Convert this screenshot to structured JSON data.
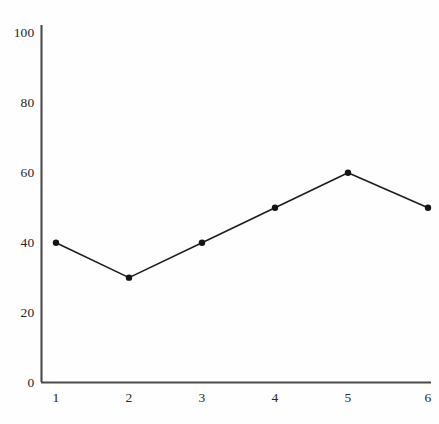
{
  "chart_data": {
    "type": "line",
    "title": "",
    "subtitle": "",
    "xlabel": "",
    "ylabel": "",
    "x": [
      1,
      2,
      3,
      4,
      5,
      6
    ],
    "values": [
      40,
      30,
      40,
      50,
      60,
      50
    ],
    "series": [
      {
        "name": "",
        "values": [
          40,
          30,
          40,
          50,
          60,
          50
        ]
      }
    ],
    "xtick_labels": [
      "1",
      "2",
      "3",
      "4",
      "5",
      "6"
    ],
    "ytick_labels": [
      "0",
      "20",
      "40",
      "60",
      "80",
      "100"
    ],
    "ytick_values": [
      0,
      20,
      40,
      60,
      80,
      100
    ],
    "xlim": [
      0.75,
      6.4
    ],
    "ylim": [
      0,
      105
    ],
    "grid": false,
    "legend": false,
    "legend_position": "none",
    "annotations": [],
    "style": {
      "line_color": "#1d1d1d",
      "marker_color": "#141414",
      "marker": "circle",
      "axis_color": "#4a4a4a",
      "background": "#fefefe",
      "line_width": 1.6,
      "marker_size": 3.2
    }
  },
  "axes": {
    "y_axis_name": "y-axis",
    "x_axis_name": "x-axis"
  }
}
